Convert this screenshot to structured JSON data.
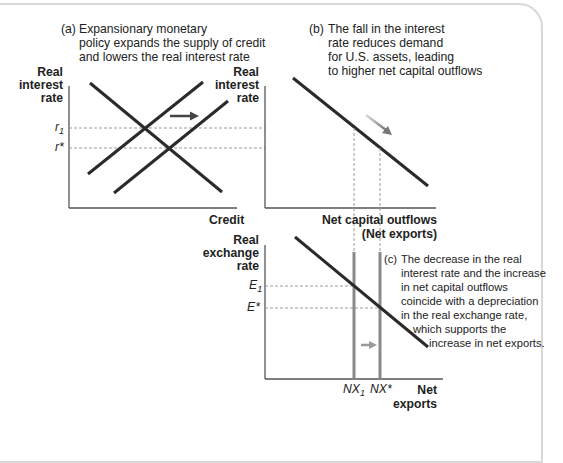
{
  "panel_a": {
    "caption_tag": "(a)",
    "caption_lines": [
      "Expansionary monetary",
      "policy expands the supply of credit",
      "and lowers the real interest rate"
    ],
    "y_label": [
      "Real",
      "interest",
      "rate"
    ],
    "x_label": "Credit",
    "y_ticks": {
      "r1": "r",
      "r1_sub": "1",
      "rstar": "r*"
    }
  },
  "panel_b": {
    "caption_tag": "(b)",
    "caption_lines": [
      "The fall in the interest",
      "rate reduces demand",
      "for U.S. assets, leading",
      "to higher net capital outflows"
    ],
    "y_label": [
      "Real",
      "interest",
      "rate"
    ],
    "x_label": [
      "Net capital outflows",
      "(Net exports)"
    ]
  },
  "panel_c": {
    "caption_tag": "(c)",
    "caption_lines": [
      "The decrease in the real",
      "interest rate and the increase",
      "in net capital outflows",
      "coincide with a depreciation",
      "in the real exchange rate,",
      "which supports the",
      "increase in net exports."
    ],
    "y_label": [
      "Real",
      "exchange",
      "rate"
    ],
    "x_label": [
      "Net",
      "exports"
    ],
    "y_ticks": {
      "e1": "E",
      "e1_sub": "1",
      "estar": "E*"
    },
    "x_ticks": {
      "nx1": "NX",
      "nx1_sub": "1",
      "nxstar": "NX*"
    }
  },
  "colors": {
    "line": "#2a2a2a",
    "gray_line": "#8a8a8a",
    "dash": "#9a9a9a",
    "arrow_gray": "#999999",
    "frame": "#d8d8d8"
  }
}
